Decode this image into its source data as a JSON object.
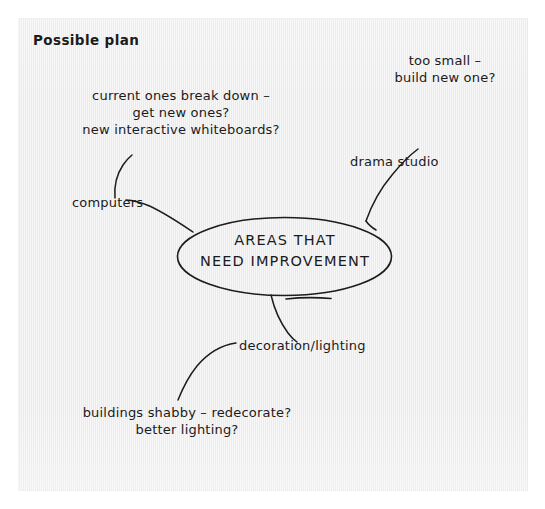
{
  "page": {
    "background_color": "#ffffff",
    "paper_color": "#ededed",
    "ink_color": "#1c1c1c"
  },
  "title": "Possible plan",
  "center_node": {
    "line1": "AREAS THAT",
    "line2": "NEED IMPROVEMENT",
    "shape": "ellipse"
  },
  "branches": [
    {
      "id": "computers",
      "label": "computers",
      "notes": [
        "current ones break down –",
        "get new ones?",
        "new interactive whiteboards?"
      ]
    },
    {
      "id": "drama-studio",
      "label": "drama studio",
      "notes": [
        "too small –",
        "build new one?"
      ]
    },
    {
      "id": "decoration-lighting",
      "label": "decoration/lighting",
      "notes": [
        "buildings shabby – redecorate?",
        "better lighting?"
      ]
    }
  ]
}
